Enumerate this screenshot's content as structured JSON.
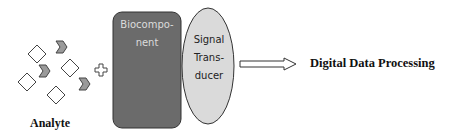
{
  "diagram": {
    "analyte_label": "Analyte",
    "biocomponent_label_line1": "Biocompo-",
    "biocomponent_label_line2": "nent",
    "transducer_label_line1": "Signal",
    "transducer_label_line2": "Trans-",
    "transducer_label_line3": "ducer",
    "output_label": "Digital Data Processing",
    "colors": {
      "biocomponent_fill": "#6b6b6b",
      "transducer_fill": "#dadada",
      "analyte_chevron_fill": "#9a9a9a",
      "analyte_diamond_fill": "#ffffff"
    }
  }
}
